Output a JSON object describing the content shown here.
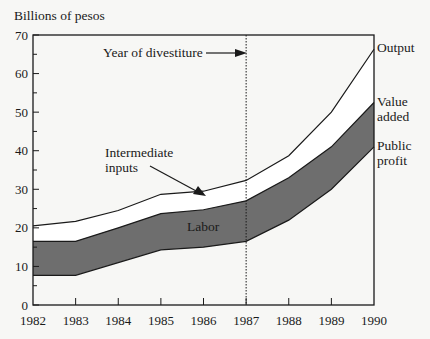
{
  "chart_data": {
    "type": "area",
    "title": "",
    "ylabel": "Billions of pesos",
    "xlabel": "",
    "x": [
      1982,
      1983,
      1984,
      1985,
      1986,
      1987,
      1988,
      1989,
      1990
    ],
    "xticks": [
      "1982",
      "1983",
      "1984",
      "1985",
      "1986",
      "1987",
      "1988",
      "1989",
      "1990"
    ],
    "yticks": [
      "0",
      "10",
      "20",
      "30",
      "40",
      "50",
      "60",
      "70"
    ],
    "ylim": [
      0,
      70
    ],
    "xlim": [
      1982,
      1990
    ],
    "grid": false,
    "series": [
      {
        "name": "Output",
        "values": [
          20.5,
          21.7,
          24.5,
          28.7,
          29.5,
          32.3,
          38.7,
          50.0,
          66.3
        ]
      },
      {
        "name": "Value added",
        "values": [
          16.5,
          16.5,
          20.0,
          23.7,
          24.7,
          27.0,
          33.0,
          41.0,
          52.5
        ]
      },
      {
        "name": "Public profit",
        "values": [
          7.7,
          7.7,
          11.0,
          14.3,
          15.0,
          16.5,
          22.0,
          30.0,
          41.0
        ]
      }
    ],
    "bands": [
      {
        "name": "Intermediate inputs",
        "between": [
          "Value added",
          "Output"
        ],
        "fill": "#ffffff"
      },
      {
        "name": "Labor",
        "between": [
          "Public profit",
          "Value added"
        ],
        "fill": "#6e6e6e"
      }
    ],
    "annotations": {
      "divestiture_label": "Year of divestiture",
      "divestiture_year": 1987,
      "intermediate_label_line1": "Intermediate",
      "intermediate_label_line2": "inputs",
      "labor_label": "Labor",
      "output_label": "Output",
      "value_added_line1": "Value",
      "value_added_line2": "added",
      "public_profit_line1": "Public",
      "public_profit_line2": "profit"
    },
    "colors": {
      "labor_band": "#6e6e6e",
      "axis": "#1a1a1a",
      "background": "#f7f7f5"
    }
  }
}
